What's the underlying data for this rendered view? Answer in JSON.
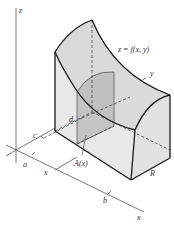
{
  "figure": {
    "type": "3d-volume-cross-section-diagram",
    "labels": {
      "z_axis": "z",
      "y_axis": "y",
      "x_axis": "x",
      "surface": "z = f(x, y)",
      "a": "a",
      "b": "b",
      "c": "c",
      "d": "d",
      "x_tick": "x",
      "cross_section": "A(x)",
      "region": "R"
    },
    "colors": {
      "outline": "#1a1a1a",
      "axis": "#444444",
      "surface_fill": "#dcdcdc",
      "side_fill": "#e6e6e6",
      "cross_section_fill": "#bdbdbd",
      "background": "#ffffff"
    }
  }
}
